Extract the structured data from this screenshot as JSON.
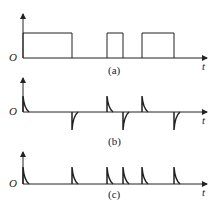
{
  "panels": [
    {
      "id": "a",
      "caption": "(a)",
      "origin_label": "O",
      "axis_label": "t",
      "description": "rectangular pulse train"
    },
    {
      "id": "b",
      "caption": "(b)",
      "origin_label": "O",
      "axis_label": "t",
      "description": "differentiated pulses: positive spikes at rising edges, negative spikes at falling edges"
    },
    {
      "id": "c",
      "caption": "(c)",
      "origin_label": "O",
      "axis_label": "t",
      "description": "rectified spikes: positive spikes at all edges"
    }
  ],
  "pulses_a": [
    [
      23,
      72
    ],
    [
      107,
      123
    ],
    [
      142,
      174
    ]
  ],
  "edges": {
    "rising": [
      23,
      107,
      142
    ],
    "falling": [
      72,
      123,
      174
    ]
  },
  "colors": {
    "ink": "#222222"
  }
}
